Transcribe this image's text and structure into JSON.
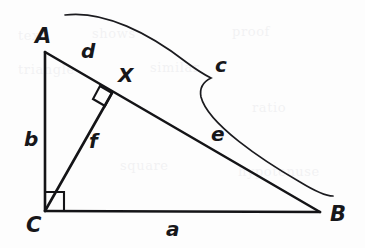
{
  "figure": {
    "background_color": "#fdfdfd",
    "ink_color": "#141417",
    "width": 365,
    "height": 248
  },
  "vertices": [
    {
      "name": "A",
      "label": "A",
      "x": 45,
      "y": 52,
      "label_x": 35,
      "label_y": 43
    },
    {
      "name": "B",
      "label": "B",
      "x": 320,
      "y": 212,
      "label_x": 330,
      "label_y": 221
    },
    {
      "name": "C",
      "label": "C",
      "x": 45,
      "y": 211,
      "label_x": 26,
      "label_y": 232
    },
    {
      "name": "X",
      "label": "X",
      "x": 112,
      "y": 93,
      "label_x": 118,
      "label_y": 82
    }
  ],
  "segments": [
    {
      "name": "side-a",
      "label": "a",
      "from": "C",
      "to": "B",
      "label_x": 166,
      "label_y": 236
    },
    {
      "name": "side-b",
      "label": "b",
      "from": "C",
      "to": "A",
      "label_x": 24,
      "label_y": 146
    },
    {
      "name": "side-c",
      "label": "c",
      "from": "A",
      "to": "B",
      "label_x": 215,
      "label_y": 72
    },
    {
      "name": "segment-d",
      "label": "d",
      "from": "A",
      "to": "X",
      "label_x": 81,
      "label_y": 58
    },
    {
      "name": "segment-e",
      "label": "e",
      "from": "X",
      "to": "B",
      "label_x": 211,
      "label_y": 141
    },
    {
      "name": "altitude-f",
      "label": "f",
      "from": "C",
      "to": "X",
      "label_x": 89,
      "label_y": 148
    }
  ],
  "right_angles": [
    {
      "name": "right-angle-at-c",
      "at": "C",
      "size": 19
    },
    {
      "name": "right-angle-at-x",
      "at": "X",
      "size": 14
    }
  ],
  "brace": {
    "name": "brace-c",
    "measures": "c",
    "start_x": 65,
    "start_y": 15,
    "peak_x": 213,
    "peak_y": 79,
    "end_x": 333,
    "end_y": 196
  },
  "ghost_marks": [
    {
      "text": "text",
      "x": 18,
      "y": 40
    },
    {
      "text": "shows",
      "x": 92,
      "y": 38
    },
    {
      "text": "proof",
      "x": 232,
      "y": 36
    },
    {
      "text": "triangle",
      "x": 18,
      "y": 74
    },
    {
      "text": "similar",
      "x": 150,
      "y": 72
    },
    {
      "text": "ratio",
      "x": 252,
      "y": 112
    },
    {
      "text": "square",
      "x": 120,
      "y": 170
    },
    {
      "text": "hypotenuse",
      "x": 238,
      "y": 176
    }
  ]
}
